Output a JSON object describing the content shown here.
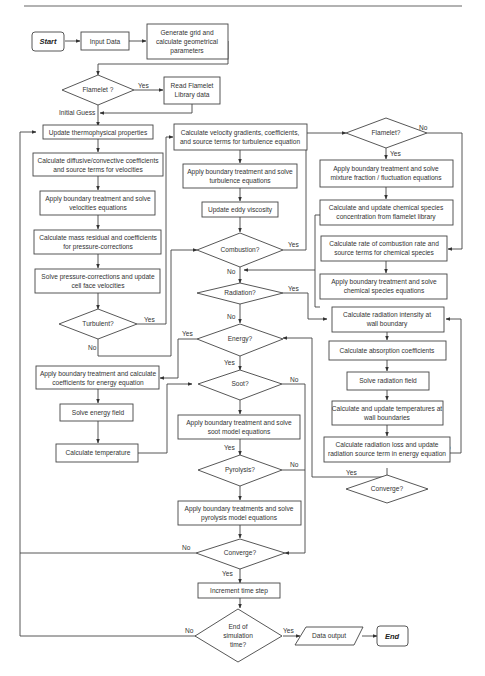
{
  "nodes": {
    "start": "Start",
    "input_data": "Input Data",
    "generate_grid": [
      "Generate grid and",
      "calculate geometrical",
      "parameters"
    ],
    "flamelet_q1": "Flamelet ?",
    "read_flamelet": [
      "Read Flamelet",
      "Library data"
    ],
    "initial_guess": "Initial Guess",
    "update_thermo": "Update thermophysical properties",
    "calc_diffusive": [
      "Calculate diffusive/convective coefficients",
      "and source terms for velocities"
    ],
    "apply_bt_velocities": [
      "Apply boundary treatment and solve",
      "velocities equations"
    ],
    "calc_mass_residual": [
      "Calculate mass residual and coefficients",
      "for pressure-corrections"
    ],
    "solve_pressure": [
      "Solve pressure-corrections and update",
      "cell face velocities"
    ],
    "turbulent_q": "Turbulent?",
    "calc_velocity_gradients": [
      "Calculate velocity gradients, coefficients,",
      "and source terms for turbulence equation"
    ],
    "apply_bt_turbulence": [
      "Apply boundary treatment and solve",
      "turbulence equations"
    ],
    "update_eddy": "Update eddy viscosity",
    "combustion_q": "Combustion?",
    "radiation_q": "Radiation?",
    "energy_q": "Energy?",
    "apply_bt_energy": [
      "Apply boundary treatment and calculate",
      "coefficients for energy equation"
    ],
    "solve_energy": "Solve energy field",
    "calc_temperature": "Calculate temperature",
    "soot_q": "Soot?",
    "apply_bt_soot": [
      "Apply boundary treatment and solve",
      "soot model equations"
    ],
    "pyrolysis_q": "Pyrolysis?",
    "apply_bt_pyrolysis": [
      "Apply boundary treatments and solve",
      "pyrolysis model equations"
    ],
    "converge_main_q": "Converge?",
    "increment_time": "Increment time step",
    "end_sim_q": [
      "End of",
      "simulation",
      "time?"
    ],
    "data_output": "Data output",
    "end": "End",
    "flamelet_q2": "Flamelet?",
    "apply_bt_mixture": [
      "Apply boundary treatment and solve",
      "mixture fraction / fluctuation equations"
    ],
    "calc_species_flamelet": [
      "Calculate and update chemical species",
      "concentration from flamelet library"
    ],
    "calc_combustion_rate": [
      "Calculate rate of combustion rate and",
      "source terms for chemical species"
    ],
    "apply_bt_species": [
      "Apply boundary treatment and solve",
      "chemical species equations"
    ],
    "calc_rad_intensity": [
      "Calculate radiation intensity at",
      "wall boundary"
    ],
    "calc_absorption": "Calculate absorption coefficients",
    "solve_radiation": "Solve radiation field",
    "calc_wall_temp": [
      "Calculate and update temperatures at",
      "wall boundaries"
    ],
    "calc_rad_loss": [
      "Calculate radiation loss and update",
      "radiation source term in energy equation"
    ],
    "converge_rad_q": "Converge?"
  },
  "edge_labels": {
    "flamelet1_yes": "Yes",
    "turbulent_yes": "Yes",
    "turbulent_no": "No",
    "combustion_yes": "Yes",
    "combustion_no": "No",
    "radiation_yes": "Yes",
    "radiation_no": "No",
    "energy_yes_left": "Yes",
    "energy_yes_down": "Yes",
    "soot_no": "No",
    "soot_yes": "Yes",
    "pyrolysis_no": "No",
    "converge_main_no": "No",
    "converge_main_yes": "Yes",
    "end_sim_no": "No",
    "end_sim_yes": "Yes",
    "flamelet2_no": "No",
    "flamelet2_yes": "Yes",
    "converge_rad_no": "No",
    "converge_rad_yes": "Yes"
  }
}
